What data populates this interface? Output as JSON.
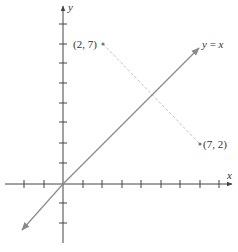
{
  "diagram": {
    "type": "coordinate-plane",
    "origin_px": [
      63,
      184
    ],
    "unit_px": 19.5,
    "axes": {
      "x_label": "x",
      "y_label": "y",
      "x_ticks": [
        -2,
        -1,
        1,
        2,
        3,
        4,
        5,
        6,
        7,
        8
      ],
      "y_ticks": [
        -2,
        -1,
        1,
        2,
        3,
        4,
        5,
        6,
        7,
        8
      ],
      "color": "#444444"
    },
    "line": {
      "label": "y = x",
      "equation_lhs": "y",
      "equation_op": " = ",
      "equation_rhs": "x",
      "color": "#8a8a8a"
    },
    "points": [
      {
        "label": "(2, 7)",
        "x": 2,
        "y": 7
      },
      {
        "label": "(7, 2)",
        "x": 7,
        "y": 2
      }
    ],
    "segment": {
      "from": [
        2,
        7
      ],
      "to": [
        7,
        2
      ],
      "style": "dashed",
      "color": "#c4c4c4"
    }
  }
}
